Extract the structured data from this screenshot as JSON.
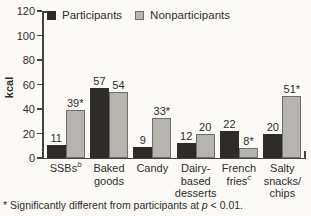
{
  "colors": {
    "background": "#fbfaf6",
    "axis": "#44433f",
    "text": "#2e2d2a",
    "participants_bar": "#2d2c29",
    "nonparticipants_bar": "#b6b4ae",
    "nonparticipants_border": "#6f6e69"
  },
  "chart_data": {
    "type": "bar",
    "title": "",
    "ylabel": "kcal",
    "xlabel": "",
    "ylim": [
      0,
      120
    ],
    "yticks": [
      0,
      20,
      40,
      60,
      80,
      100,
      120
    ],
    "grid": false,
    "legend_position": "top-left-inside",
    "categories": [
      {
        "lines": [
          "SSBs"
        ],
        "sup": "b"
      },
      {
        "lines": [
          "Baked",
          "goods"
        ],
        "sup": ""
      },
      {
        "lines": [
          "Candy"
        ],
        "sup": ""
      },
      {
        "lines": [
          "Dairy-",
          "based",
          "desserts"
        ],
        "sup": ""
      },
      {
        "lines": [
          "French",
          "fries"
        ],
        "sup": "c"
      },
      {
        "lines": [
          "Salty",
          "snacks/",
          "chips"
        ],
        "sup": ""
      }
    ],
    "series": [
      {
        "name": "Participants",
        "color": "#2d2c29",
        "border": "#2d2c29",
        "values": [
          11,
          57,
          9,
          12,
          22,
          20
        ],
        "labels": [
          "11",
          "57",
          "9",
          "12",
          "22",
          "20"
        ]
      },
      {
        "name": "Nonparticipants",
        "color": "#b6b4ae",
        "border": "#6f6e69",
        "values": [
          39,
          54,
          33,
          20,
          8,
          51
        ],
        "labels": [
          "39*",
          "54",
          "33*",
          "20",
          "8*",
          "51*"
        ]
      }
    ]
  },
  "footnote": {
    "marker": "* ",
    "text": "Significantly different from participants at ",
    "italic": "p",
    "suffix": " < 0.01."
  }
}
